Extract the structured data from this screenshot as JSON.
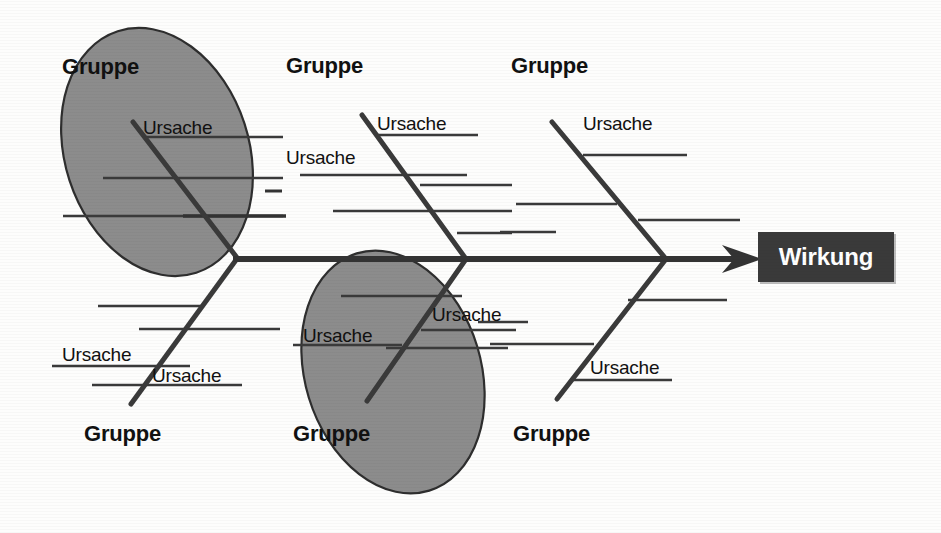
{
  "diagram": {
    "type": "ishikawa-fishbone",
    "language": "de",
    "effect": {
      "label": "Wirkung",
      "box_color": "#3a3a3a",
      "text_color": "#ffffff"
    },
    "spine": {
      "color": "#333333",
      "has_arrowhead": true
    },
    "highlight_color": "#8c8c8c",
    "highlights": [
      {
        "name": "upper-left-group-highlight"
      },
      {
        "name": "lower-middle-group-highlight"
      }
    ],
    "groups": [
      {
        "id": "group-upper-1",
        "label": "Gruppe",
        "side": "upper",
        "highlighted": true,
        "causes": [
          {
            "label": "Ursache"
          },
          {
            "label": ""
          },
          {
            "label": ""
          },
          {
            "label": ""
          }
        ]
      },
      {
        "id": "group-upper-2",
        "label": "Gruppe",
        "side": "upper",
        "highlighted": false,
        "causes": [
          {
            "label": "Ursache"
          },
          {
            "label": "Ursache"
          },
          {
            "label": ""
          },
          {
            "label": ""
          }
        ]
      },
      {
        "id": "group-upper-3",
        "label": "Gruppe",
        "side": "upper",
        "highlighted": false,
        "causes": [
          {
            "label": "Ursache"
          },
          {
            "label": ""
          },
          {
            "label": ""
          }
        ]
      },
      {
        "id": "group-lower-1",
        "label": "Gruppe",
        "side": "lower",
        "highlighted": false,
        "causes": [
          {
            "label": "Ursache"
          },
          {
            "label": "Ursache"
          },
          {
            "label": ""
          },
          {
            "label": ""
          }
        ]
      },
      {
        "id": "group-lower-2",
        "label": "Gruppe",
        "side": "lower",
        "highlighted": true,
        "causes": [
          {
            "label": "Ursache"
          },
          {
            "label": "Ursache"
          },
          {
            "label": ""
          },
          {
            "label": ""
          }
        ]
      },
      {
        "id": "group-lower-3",
        "label": "Gruppe",
        "side": "lower",
        "highlighted": false,
        "causes": [
          {
            "label": "Ursache"
          },
          {
            "label": ""
          },
          {
            "label": ""
          }
        ]
      }
    ]
  },
  "labels": {
    "group_upper_1": "Gruppe",
    "group_upper_2": "Gruppe",
    "group_upper_3": "Gruppe",
    "group_lower_1": "Gruppe",
    "group_lower_2": "Gruppe",
    "group_lower_3": "Gruppe",
    "cause_u1_a": "Ursache",
    "cause_u2_a": "Ursache",
    "cause_u2_b": "Ursache",
    "cause_u3_a": "Ursache",
    "cause_l1_a": "Ursache",
    "cause_l1_b": "Ursache",
    "cause_l2_a": "Ursache",
    "cause_l2_b": "Ursache",
    "cause_l3_a": "Ursache",
    "effect": "Wirkung"
  }
}
